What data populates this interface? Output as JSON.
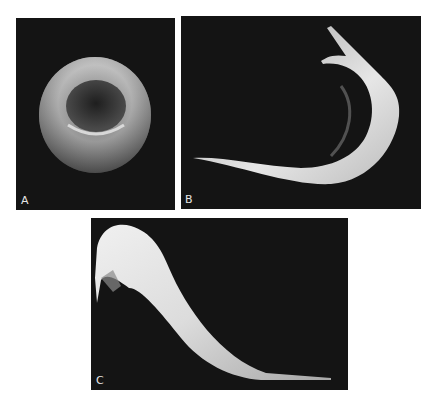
{
  "figure": {
    "panels": [
      {
        "label": "A",
        "subject": "normal red blood cell (biconcave disc)"
      },
      {
        "label": "B",
        "subject": "sickle-shaped red blood cell"
      },
      {
        "label": "C",
        "subject": "elongated sickle red blood cell"
      }
    ],
    "colors": {
      "background": "#ffffff",
      "panel": "#141414",
      "cell": "#d9d9d9",
      "label": "#e6e6e6"
    }
  }
}
